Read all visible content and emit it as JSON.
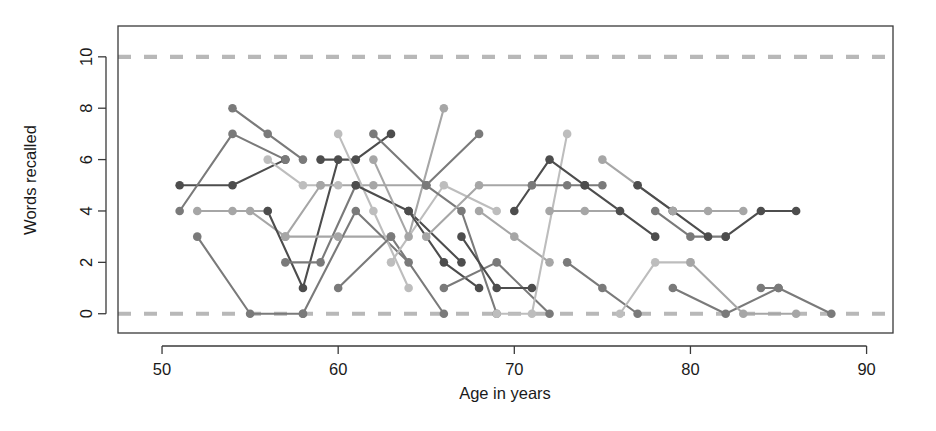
{
  "chart_data": {
    "type": "line",
    "title": "",
    "xlabel": "Age in years",
    "ylabel": "Words recalled",
    "xlim": [
      47.5,
      91.5
    ],
    "ylim": [
      -0.75,
      11.2
    ],
    "xticks": [
      50,
      60,
      70,
      80,
      90
    ],
    "yticks": [
      0,
      2,
      4,
      6,
      8,
      10
    ],
    "xtick_labels": [
      "50",
      "60",
      "70",
      "80",
      "90"
    ],
    "ytick_labels": [
      "0",
      "2",
      "4",
      "6",
      "8",
      "10"
    ],
    "grid": "dashed horizontal reference lines at y=0 and y=10",
    "gridlines": [
      0,
      10
    ],
    "legend": "none",
    "marker": "filled circle",
    "colors": {
      "dark_gray": "#4d4d4d",
      "mid_gray": "#7a7a7a",
      "light_gray": "#a6a6a6",
      "pale_gray": "#bdbdbd",
      "gridline": "#b8b8b8",
      "axis": "#3a3a3a",
      "text": "#1a1a1a"
    },
    "series": [
      {
        "name": "s01",
        "shade": "dark_gray",
        "x": [
          51,
          54,
          57
        ],
        "values": [
          5,
          5,
          6
        ]
      },
      {
        "name": "s02",
        "shade": "mid_gray",
        "x": [
          51,
          54,
          57
        ],
        "values": [
          4,
          7,
          6
        ]
      },
      {
        "name": "s03",
        "shade": "mid_gray",
        "x": [
          52,
          55,
          58
        ],
        "values": [
          3,
          0,
          0
        ]
      },
      {
        "name": "s04",
        "shade": "light_gray",
        "x": [
          52,
          54,
          56
        ],
        "values": [
          4,
          4,
          4
        ]
      },
      {
        "name": "s05",
        "shade": "mid_gray",
        "x": [
          54,
          56,
          58
        ],
        "values": [
          8,
          7,
          6
        ]
      },
      {
        "name": "s06",
        "shade": "light_gray",
        "x": [
          55,
          57,
          59
        ],
        "values": [
          4,
          3,
          5
        ]
      },
      {
        "name": "s07",
        "shade": "pale_gray",
        "x": [
          56,
          58,
          60
        ],
        "values": [
          6,
          5,
          5
        ]
      },
      {
        "name": "s08",
        "shade": "dark_gray",
        "x": [
          56,
          58,
          60
        ],
        "values": [
          4,
          1,
          6
        ]
      },
      {
        "name": "s09",
        "shade": "mid_gray",
        "x": [
          57,
          59,
          61
        ],
        "values": [
          2,
          2,
          5
        ]
      },
      {
        "name": "s10",
        "shade": "light_gray",
        "x": [
          57,
          60,
          63
        ],
        "values": [
          3,
          3,
          3
        ]
      },
      {
        "name": "s11",
        "shade": "mid_gray",
        "x": [
          58,
          61,
          64
        ],
        "values": [
          0,
          4,
          2
        ]
      },
      {
        "name": "s12",
        "shade": "dark_gray",
        "x": [
          59,
          61,
          63
        ],
        "values": [
          6,
          6,
          7
        ]
      },
      {
        "name": "s13",
        "shade": "light_gray",
        "x": [
          59,
          62,
          65
        ],
        "values": [
          5,
          5,
          5
        ]
      },
      {
        "name": "s14",
        "shade": "pale_gray",
        "x": [
          60,
          62,
          64
        ],
        "values": [
          7,
          4,
          1
        ]
      },
      {
        "name": "s15",
        "shade": "mid_gray",
        "x": [
          60,
          63,
          66
        ],
        "values": [
          1,
          3,
          0
        ]
      },
      {
        "name": "s16",
        "shade": "dark_gray",
        "x": [
          61,
          64,
          67
        ],
        "values": [
          5,
          4,
          2
        ]
      },
      {
        "name": "s17",
        "shade": "light_gray",
        "x": [
          62,
          64,
          66
        ],
        "values": [
          6,
          3,
          8
        ]
      },
      {
        "name": "s18",
        "shade": "mid_gray",
        "x": [
          62,
          65,
          68
        ],
        "values": [
          7,
          5,
          7
        ]
      },
      {
        "name": "s19",
        "shade": "pale_gray",
        "x": [
          63,
          66,
          69
        ],
        "values": [
          2,
          5,
          4
        ]
      },
      {
        "name": "s20",
        "shade": "dark_gray",
        "x": [
          64,
          66,
          68
        ],
        "values": [
          4,
          2,
          1
        ]
      },
      {
        "name": "s21",
        "shade": "mid_gray",
        "x": [
          65,
          67,
          69
        ],
        "values": [
          5,
          4,
          0
        ]
      },
      {
        "name": "s22",
        "shade": "light_gray",
        "x": [
          65,
          68,
          71
        ],
        "values": [
          3,
          5,
          5
        ]
      },
      {
        "name": "s23",
        "shade": "mid_gray",
        "x": [
          66,
          69,
          72
        ],
        "values": [
          1,
          2,
          0
        ]
      },
      {
        "name": "s24",
        "shade": "dark_gray",
        "x": [
          67,
          69,
          71
        ],
        "values": [
          3,
          1,
          1
        ]
      },
      {
        "name": "s25",
        "shade": "light_gray",
        "x": [
          68,
          70,
          72
        ],
        "values": [
          4,
          3,
          2
        ]
      },
      {
        "name": "s26",
        "shade": "pale_gray",
        "x": [
          69,
          71,
          73
        ],
        "values": [
          0,
          0,
          7
        ]
      },
      {
        "name": "s27",
        "shade": "dark_gray",
        "x": [
          70,
          72,
          74
        ],
        "values": [
          4,
          6,
          5
        ]
      },
      {
        "name": "s28",
        "shade": "mid_gray",
        "x": [
          71,
          73,
          75
        ],
        "values": [
          5,
          5,
          5
        ]
      },
      {
        "name": "s29",
        "shade": "light_gray",
        "x": [
          72,
          74,
          76
        ],
        "values": [
          4,
          4,
          4
        ]
      },
      {
        "name": "s30",
        "shade": "mid_gray",
        "x": [
          73,
          75,
          77
        ],
        "values": [
          2,
          1,
          0
        ]
      },
      {
        "name": "s31",
        "shade": "dark_gray",
        "x": [
          74,
          76,
          78
        ],
        "values": [
          5,
          4,
          3
        ]
      },
      {
        "name": "s32",
        "shade": "light_gray",
        "x": [
          75,
          77,
          79
        ],
        "values": [
          6,
          5,
          4
        ]
      },
      {
        "name": "s33",
        "shade": "pale_gray",
        "x": [
          76,
          78,
          80
        ],
        "values": [
          0,
          2,
          2
        ]
      },
      {
        "name": "s34",
        "shade": "dark_gray",
        "x": [
          77,
          79,
          81
        ],
        "values": [
          5,
          4,
          3
        ]
      },
      {
        "name": "s35",
        "shade": "mid_gray",
        "x": [
          78,
          80,
          82
        ],
        "values": [
          4,
          3,
          3
        ]
      },
      {
        "name": "s36",
        "shade": "light_gray",
        "x": [
          79,
          81,
          83
        ],
        "values": [
          4,
          4,
          4
        ]
      },
      {
        "name": "s37",
        "shade": "mid_gray",
        "x": [
          79,
          82,
          85
        ],
        "values": [
          1,
          0,
          1
        ]
      },
      {
        "name": "s38",
        "shade": "light_gray",
        "x": [
          80,
          83,
          86
        ],
        "values": [
          2,
          0,
          0
        ]
      },
      {
        "name": "s39",
        "shade": "dark_gray",
        "x": [
          82,
          84,
          86
        ],
        "values": [
          3,
          4,
          4
        ]
      },
      {
        "name": "s40",
        "shade": "mid_gray",
        "x": [
          84,
          85,
          88
        ],
        "values": [
          1,
          1,
          0
        ]
      }
    ],
    "gridline_y_values": [
      0,
      10
    ],
    "note": "Reference dashed lines mark the floor (0) and ceiling (10) of the recall scale"
  },
  "figure": {
    "background": "#ffffff",
    "box_border": true
  }
}
